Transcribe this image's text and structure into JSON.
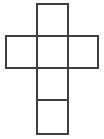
{
  "figure": {
    "name": "cube-net-cross",
    "background_color": "#ffffff",
    "stroke_color": "#3f3f3f",
    "stroke_width": 2,
    "canvas": {
      "width": 104,
      "height": 139
    },
    "square_size": 31,
    "square_count": 6,
    "labels": []
  },
  "chart_data": {
    "type": "diagram",
    "xlabel": "",
    "ylabel": "",
    "xlim": [
      0,
      104
    ],
    "ylim": [
      0,
      139
    ],
    "grid": false,
    "legend": "none",
    "squares": [
      {
        "id": "top",
        "x": 37,
        "y": 4,
        "w": 31,
        "h": 32,
        "label": ""
      },
      {
        "id": "middle-left",
        "x": 6,
        "y": 36,
        "w": 31,
        "h": 32,
        "label": ""
      },
      {
        "id": "middle-center",
        "x": 37,
        "y": 36,
        "w": 31,
        "h": 32,
        "label": ""
      },
      {
        "id": "middle-right",
        "x": 68,
        "y": 36,
        "w": 30,
        "h": 32,
        "label": ""
      },
      {
        "id": "lower",
        "x": 37,
        "y": 68,
        "w": 31,
        "h": 32,
        "label": ""
      },
      {
        "id": "bottom",
        "x": 37,
        "y": 100,
        "w": 31,
        "h": 34,
        "label": ""
      }
    ]
  }
}
